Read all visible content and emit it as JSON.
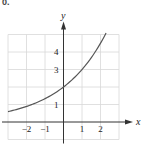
{
  "fragment_label": "0.",
  "chart_data": {
    "type": "line",
    "title": "",
    "xlabel": "x",
    "ylabel": "y",
    "xlim": [
      -3,
      3
    ],
    "ylim": [
      -1,
      5
    ],
    "grid": true,
    "x_ticks": [
      -2,
      -1,
      1,
      2
    ],
    "y_ticks": [
      1,
      3,
      4
    ],
    "x_tick_labels": [
      "−2",
      "−1",
      "1",
      "2"
    ],
    "y_tick_labels": [
      "1",
      "3",
      "4"
    ],
    "series": [
      {
        "name": "curve",
        "function": "y = 2·(1.5)^x",
        "x": [
          -3,
          -2.5,
          -2,
          -1.5,
          -1,
          -0.5,
          0,
          0.5,
          1,
          1.5,
          2,
          2.3
        ],
        "y": [
          0.59,
          0.73,
          0.89,
          1.09,
          1.33,
          1.63,
          2.0,
          2.45,
          3.0,
          3.67,
          4.5,
          5.0
        ]
      }
    ],
    "colors": {
      "curve": "#555555",
      "axes": "#333333",
      "grid": "#d8d8d8"
    }
  }
}
